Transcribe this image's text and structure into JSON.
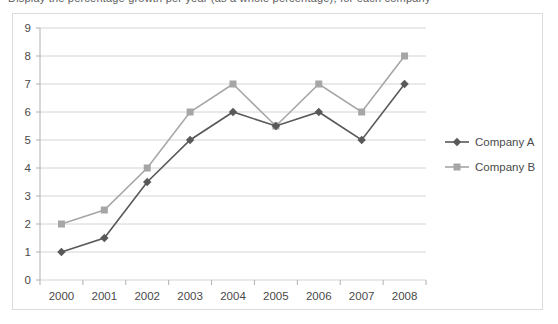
{
  "top_partial_text": "Display the percentage growth per year (as a whole percentage), for each company",
  "chart_data": {
    "type": "line",
    "title": "",
    "xlabel": "",
    "ylabel": "",
    "categories": [
      "2000",
      "2001",
      "2002",
      "2003",
      "2004",
      "2005",
      "2006",
      "2007",
      "2008"
    ],
    "ylim": [
      0,
      9
    ],
    "ytick_step": 1,
    "yticks": [
      "0",
      "1",
      "2",
      "3",
      "4",
      "5",
      "6",
      "7",
      "8",
      "9"
    ],
    "grid": "horizontal",
    "legend_position": "right",
    "series": [
      {
        "name": "Company A",
        "color": "#595959",
        "marker": "diamond",
        "values": [
          1,
          1.5,
          3.5,
          5,
          6,
          5.5,
          6,
          5,
          7
        ]
      },
      {
        "name": "Company B",
        "color": "#a6a6a6",
        "marker": "square",
        "values": [
          2,
          2.5,
          4,
          6,
          7,
          5.5,
          7,
          6,
          8
        ]
      }
    ]
  },
  "colors": {
    "series_a": "#595959",
    "series_b": "#a6a6a6",
    "grid": "#d4d4d4",
    "axis": "#b0b0b0",
    "frame": "#dcdcdc",
    "text": "#4a4a4a"
  }
}
